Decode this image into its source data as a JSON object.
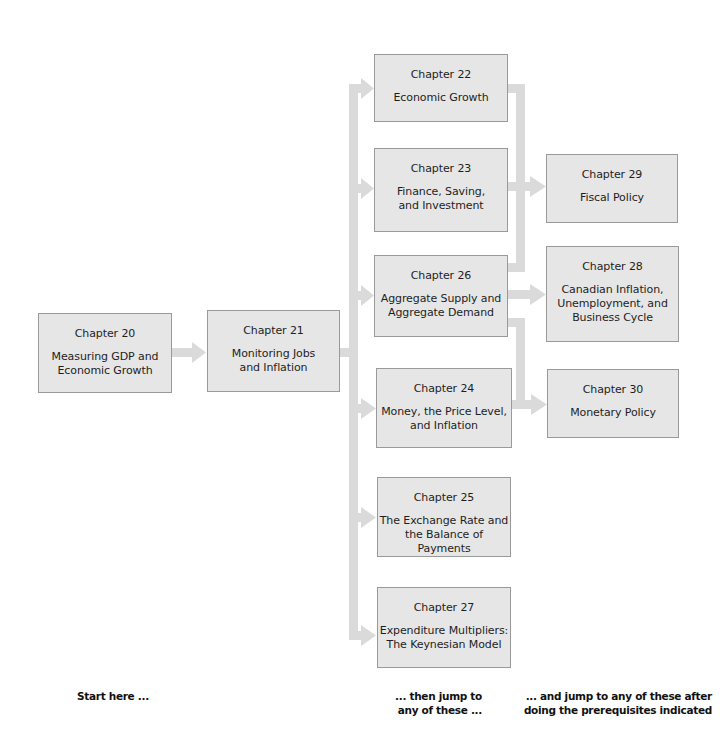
{
  "colors": {
    "box_fill": "#e6e6e6",
    "box_border": "#9a9a9a",
    "connector": "#dadada"
  },
  "chapters": {
    "ch20": {
      "number": "Chapter 20",
      "title": "Measuring GDP and\nEconomic Growth"
    },
    "ch21": {
      "number": "Chapter 21",
      "title": "Monitoring Jobs\nand Inflation"
    },
    "ch22": {
      "number": "Chapter 22",
      "title": "Economic Growth"
    },
    "ch23": {
      "number": "Chapter 23",
      "title": "Finance, Saving,\nand Investment"
    },
    "ch26": {
      "number": "Chapter 26",
      "title": "Aggregate Supply and\nAggregate Demand"
    },
    "ch24": {
      "number": "Chapter 24",
      "title": "Money, the Price Level,\nand Inflation"
    },
    "ch25": {
      "number": "Chapter 25",
      "title": "The Exchange Rate and\nthe Balance of Payments"
    },
    "ch27": {
      "number": "Chapter 27",
      "title": "Expenditure Multipliers:\nThe Keynesian Model"
    },
    "ch29": {
      "number": "Chapter 29",
      "title": "Fiscal Policy"
    },
    "ch28": {
      "number": "Chapter 28",
      "title": "Canadian Inflation,\nUnemployment, and\nBusiness Cycle"
    },
    "ch30": {
      "number": "Chapter 30",
      "title": "Monetary Policy"
    }
  },
  "labels": {
    "start": "Start here ...",
    "then": "... then jump to\nany of these ...",
    "and": "... and jump to any of these after\ndoing the prerequisites indicated"
  },
  "edges": [
    [
      "ch20",
      "ch21"
    ],
    [
      "ch21",
      "ch22"
    ],
    [
      "ch21",
      "ch23"
    ],
    [
      "ch21",
      "ch26"
    ],
    [
      "ch21",
      "ch24"
    ],
    [
      "ch21",
      "ch25"
    ],
    [
      "ch21",
      "ch27"
    ],
    [
      "ch22",
      "ch29"
    ],
    [
      "ch23",
      "ch29"
    ],
    [
      "ch26",
      "ch29"
    ],
    [
      "ch26",
      "ch28"
    ],
    [
      "ch26",
      "ch30"
    ],
    [
      "ch24",
      "ch30"
    ]
  ]
}
